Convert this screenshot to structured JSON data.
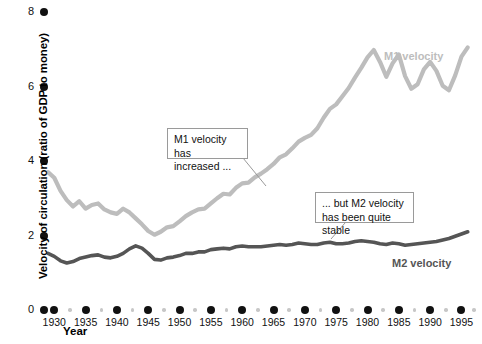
{
  "chart_data": {
    "type": "line",
    "title": "",
    "xlabel": "Year",
    "ylabel": "Velocity of circulation (ratio of GDP to money)",
    "xlim": [
      1929,
      1997
    ],
    "ylim": [
      0,
      8
    ],
    "yticks": [
      0,
      2,
      4,
      6,
      8
    ],
    "xticks": [
      1930,
      1935,
      1940,
      1945,
      1950,
      1955,
      1960,
      1965,
      1970,
      1975,
      1980,
      1985,
      1990,
      1995
    ],
    "minor_xticks": [
      1932.5,
      1937.5,
      1942.5,
      1947.5,
      1952.5,
      1957.5,
      1962.5,
      1967.5,
      1972.5,
      1977.5,
      1982.5,
      1987.5,
      1992.5,
      1997
    ],
    "grid": false,
    "legend_position": "inline-labels",
    "x": [
      1929,
      1930,
      1931,
      1932,
      1933,
      1934,
      1935,
      1936,
      1937,
      1938,
      1939,
      1940,
      1941,
      1942,
      1943,
      1944,
      1945,
      1946,
      1947,
      1948,
      1949,
      1950,
      1951,
      1952,
      1953,
      1954,
      1955,
      1956,
      1957,
      1958,
      1959,
      1960,
      1961,
      1962,
      1963,
      1964,
      1965,
      1966,
      1967,
      1968,
      1969,
      1970,
      1971,
      1972,
      1973,
      1974,
      1975,
      1976,
      1977,
      1978,
      1979,
      1980,
      1981,
      1982,
      1983,
      1984,
      1985,
      1986,
      1987,
      1988,
      1989,
      1990,
      1991,
      1992,
      1993,
      1994,
      1995,
      1996
    ],
    "series": [
      {
        "name": "M1 velocity",
        "color": "#bdbdbd",
        "values": [
          3.7,
          3.55,
          3.2,
          2.95,
          2.78,
          2.92,
          2.72,
          2.82,
          2.86,
          2.7,
          2.62,
          2.58,
          2.72,
          2.62,
          2.46,
          2.3,
          2.12,
          2.02,
          2.1,
          2.22,
          2.25,
          2.38,
          2.52,
          2.62,
          2.7,
          2.72,
          2.86,
          3.0,
          3.12,
          3.1,
          3.28,
          3.4,
          3.42,
          3.56,
          3.66,
          3.78,
          3.92,
          4.1,
          4.18,
          4.34,
          4.52,
          4.62,
          4.7,
          4.88,
          5.16,
          5.4,
          5.52,
          5.74,
          5.96,
          6.24,
          6.5,
          6.78,
          6.98,
          6.66,
          6.26,
          6.62,
          6.86,
          6.28,
          5.94,
          6.06,
          6.46,
          6.66,
          6.42,
          6.02,
          5.9,
          6.3,
          6.8,
          7.05
        ]
      },
      {
        "name": "M2 velocity",
        "color": "#555555",
        "values": [
          1.52,
          1.44,
          1.32,
          1.26,
          1.3,
          1.38,
          1.42,
          1.46,
          1.48,
          1.42,
          1.4,
          1.44,
          1.52,
          1.64,
          1.72,
          1.66,
          1.52,
          1.36,
          1.34,
          1.4,
          1.42,
          1.46,
          1.52,
          1.52,
          1.56,
          1.56,
          1.62,
          1.64,
          1.66,
          1.64,
          1.7,
          1.72,
          1.7,
          1.7,
          1.7,
          1.72,
          1.74,
          1.76,
          1.74,
          1.76,
          1.8,
          1.78,
          1.76,
          1.76,
          1.8,
          1.82,
          1.78,
          1.78,
          1.8,
          1.84,
          1.86,
          1.84,
          1.82,
          1.78,
          1.76,
          1.8,
          1.78,
          1.74,
          1.76,
          1.78,
          1.8,
          1.82,
          1.84,
          1.88,
          1.92,
          1.98,
          2.04,
          2.1
        ]
      }
    ],
    "annotations": [
      {
        "id": "m1-annotation",
        "text": "M1 velocity has\nincreased ...",
        "box": {
          "x": 167,
          "y": 128,
          "w": 81,
          "h": 31
        },
        "leader": {
          "x1": 243,
          "y1": 158,
          "x2": 266,
          "y2": 186
        }
      },
      {
        "id": "m2-annotation",
        "text": "... but M2 velocity\nhas been quite stable",
        "box": {
          "x": 315,
          "y": 192,
          "w": 99,
          "h": 31
        },
        "leader": {
          "x1": 345,
          "y1": 223,
          "x2": 331,
          "y2": 239
        }
      }
    ],
    "series_labels": [
      {
        "text": "M1 velocity",
        "x": 384,
        "y": 50,
        "color": "#bdbdbd"
      },
      {
        "text": "M2 velocity",
        "x": 392,
        "y": 257,
        "color": "#555555"
      }
    ]
  },
  "axis": {
    "y_label": "Velocity of circulation (ratio of GDP to money)",
    "x_label": "Year",
    "y_ticks": [
      "8",
      "6",
      "4",
      "2",
      "0"
    ],
    "x_ticks": [
      "1930",
      "1935",
      "1940",
      "1945",
      "1950",
      "1955",
      "1960",
      "1965",
      "1970",
      "1975",
      "1980",
      "1985",
      "1990",
      "1995"
    ]
  },
  "colors": {
    "m1": "#bdbdbd",
    "m2": "#555555",
    "tick_major": "#111111",
    "tick_minor": "#c7c7c7",
    "annotation_border": "#9a9a9a",
    "background": "#ffffff"
  }
}
